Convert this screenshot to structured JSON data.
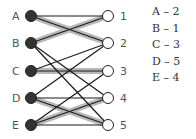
{
  "diagram": {
    "type": "bipartite-matching",
    "left_nodes": [
      {
        "id": "A",
        "y": 16
      },
      {
        "id": "B",
        "y": 43
      },
      {
        "id": "C",
        "y": 71
      },
      {
        "id": "D",
        "y": 98
      },
      {
        "id": "E",
        "y": 125
      }
    ],
    "right_nodes": [
      {
        "id": "1",
        "y": 16
      },
      {
        "id": "2",
        "y": 43
      },
      {
        "id": "3",
        "y": 71
      },
      {
        "id": "4",
        "y": 98
      },
      {
        "id": "5",
        "y": 125
      }
    ],
    "edges": [
      {
        "from": "A",
        "to": "1",
        "matched": false
      },
      {
        "from": "A",
        "to": "2",
        "matched": true
      },
      {
        "from": "B",
        "to": "1",
        "matched": true
      },
      {
        "from": "B",
        "to": "4",
        "matched": false
      },
      {
        "from": "B",
        "to": "5",
        "matched": false
      },
      {
        "from": "C",
        "to": "2",
        "matched": false
      },
      {
        "from": "C",
        "to": "3",
        "matched": true
      },
      {
        "from": "D",
        "to": "2",
        "matched": false
      },
      {
        "from": "D",
        "to": "4",
        "matched": false
      },
      {
        "from": "D",
        "to": "5",
        "matched": true
      },
      {
        "from": "E",
        "to": "3",
        "matched": false
      },
      {
        "from": "E",
        "to": "4",
        "matched": true
      },
      {
        "from": "E",
        "to": "5",
        "matched": false
      }
    ],
    "colors": {
      "edge": "#1a1a1a",
      "highlight": "#b8b8b8",
      "left_fill": "#333333",
      "right_fill": "#ffffff"
    }
  },
  "matching": [
    "A – 2",
    "B – 1",
    "C – 3",
    "D – 5",
    "E – 4"
  ]
}
